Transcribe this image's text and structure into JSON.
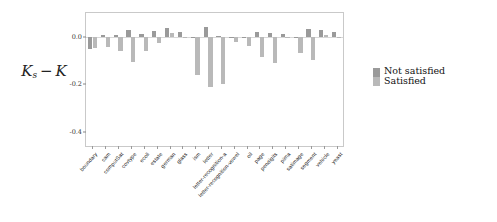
{
  "chart_data": {
    "type": "bar",
    "title": "",
    "xlabel": "",
    "ylabel": "K_s - K",
    "ylim": [
      -0.46,
      0.1
    ],
    "yticks": [
      0.0,
      -0.2,
      -0.4
    ],
    "ytick_labels": [
      "0.0",
      "-0.2",
      "-0.4"
    ],
    "grid": false,
    "legend_position": "right",
    "categories": [
      "boundary",
      "cam",
      "computSat",
      "covtype",
      "ecoli",
      "estate",
      "german",
      "glass",
      "ism",
      "letter",
      "letter-recognition-a",
      "letter-recognition-vowel",
      "oil",
      "page",
      "pendigits",
      "pima",
      "satimage",
      "segment",
      "vehicle",
      "yeast"
    ],
    "series": [
      {
        "name": "Not satisfied",
        "color": "#9a9a9a",
        "values": [
          -0.053,
          0.006,
          0.008,
          0.028,
          0.01,
          0.024,
          0.035,
          0.021,
          -0.004,
          0.041,
          0.004,
          0.0,
          -0.001,
          0.021,
          0.014,
          0.012,
          -0.002,
          0.032,
          0.03,
          0.021
        ]
      },
      {
        "name": "Satisfied",
        "color": "#b9b9b9",
        "values": [
          -0.047,
          -0.044,
          -0.06,
          -0.105,
          -0.058,
          -0.025,
          0.015,
          0.0,
          -0.163,
          -0.212,
          -0.201,
          -0.02,
          -0.039,
          -0.087,
          -0.112,
          0.0,
          -0.07,
          -0.097,
          0.008,
          0.0
        ]
      }
    ],
    "legend": [
      {
        "label": "Not satisfied",
        "color": "#9a9a9a"
      },
      {
        "label": "Satisfied",
        "color": "#b9b9b9"
      }
    ]
  },
  "axis": {
    "ylabel_main": "K",
    "ylabel_sub": "s",
    "ylabel_minus": "−",
    "ylabel_second": "K"
  }
}
